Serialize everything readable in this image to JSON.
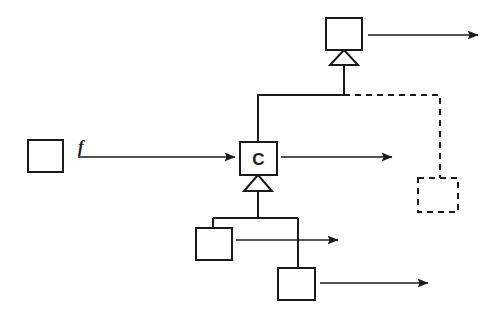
{
  "diagram": {
    "style": {
      "stroke_color": "#1a1a1a",
      "background_color": "#ffffff",
      "fill_color": "#ffffff",
      "solid_stroke_width": 2,
      "dashed_stroke_width": 2,
      "dash_pattern": "6,5"
    },
    "nodes": [
      {
        "id": "source-box",
        "name": "source-class-box",
        "label": "",
        "kind": "class",
        "border": "solid",
        "x": 28,
        "y": 140,
        "w": 35,
        "h": 32
      },
      {
        "id": "center-box",
        "name": "class-c-box",
        "label": "C",
        "kind": "class",
        "border": "solid",
        "x": 240,
        "y": 142,
        "w": 37,
        "h": 33
      },
      {
        "id": "top-box",
        "name": "superclass-box",
        "label": "",
        "kind": "class",
        "border": "solid",
        "x": 326,
        "y": 18,
        "w": 36,
        "h": 32
      },
      {
        "id": "sub-box-1",
        "name": "subclass-box-1",
        "label": "",
        "kind": "class",
        "border": "solid",
        "x": 196,
        "y": 228,
        "w": 36,
        "h": 32
      },
      {
        "id": "sub-box-2",
        "name": "subclass-box-2",
        "label": "",
        "kind": "class",
        "border": "solid",
        "x": 278,
        "y": 268,
        "w": 37,
        "h": 32
      },
      {
        "id": "dashed-box",
        "name": "dependent-class-box",
        "label": "",
        "kind": "class",
        "border": "dashed",
        "x": 418,
        "y": 178,
        "w": 40,
        "h": 34
      }
    ],
    "edge_labels": [
      {
        "id": "f-label",
        "name": "function-f-label",
        "text": "f",
        "x": 78,
        "y": 152
      }
    ],
    "arrows": [
      {
        "id": "arrow-into-c",
        "name": "arrow-f-to-class-c",
        "x1": 78,
        "y1": 157,
        "x2": 235,
        "y2": 157
      },
      {
        "id": "arrow-from-c",
        "name": "arrow-from-class-c",
        "x1": 281,
        "y1": 157,
        "x2": 392,
        "y2": 157
      },
      {
        "id": "arrow-from-top",
        "name": "arrow-from-superclass",
        "x1": 368,
        "y1": 35,
        "x2": 478,
        "y2": 35
      },
      {
        "id": "arrow-from-sub1",
        "name": "arrow-from-subclass-1",
        "x1": 236,
        "y1": 240,
        "x2": 338,
        "y2": 240
      },
      {
        "id": "arrow-from-sub2",
        "name": "arrow-from-subclass-2",
        "x1": 320,
        "y1": 283,
        "x2": 428,
        "y2": 283
      }
    ],
    "generalizations": [
      {
        "id": "gen-c-to-top",
        "name": "generalization-c-to-superclass",
        "from": "center-box",
        "to": "top-box",
        "triangle": {
          "apex_x": 344,
          "apex_y": 50,
          "half_width": 14,
          "height": 15
        },
        "path": "M 258 142 L 258 95 L 344 95 L 344 65"
      },
      {
        "id": "gen-subs-to-c",
        "name": "generalization-subclasses-to-c",
        "from": [
          "sub-box-1",
          "sub-box-2"
        ],
        "to": "center-box",
        "triangle": {
          "apex_x": 258,
          "apex_y": 175,
          "half_width": 14,
          "height": 16
        },
        "path": "M 258 191 L 258 218 M 213 218 L 298 218 M 213 218 L 213 228 M 298 218 L 298 268"
      }
    ],
    "dependencies": [
      {
        "id": "dep-to-dashed",
        "name": "dependency-to-dependent-class",
        "from": "gen-c-to-top",
        "to": "dashed-box",
        "path": "M 344 95 L 440 95 L 440 178",
        "style": "dashed"
      }
    ]
  }
}
